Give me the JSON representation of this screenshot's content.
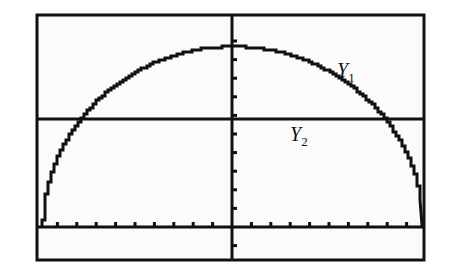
{
  "chart_data": {
    "type": "line",
    "title": "",
    "xlabel": "",
    "ylabel": "",
    "grid": false,
    "legend": "inline labels",
    "xlim": [
      -10,
      10
    ],
    "ylim": [
      -2,
      11
    ],
    "x_tick_spacing": 1,
    "y_tick_spacing": 1,
    "series": [
      {
        "name": "Y1",
        "label_text": "Y",
        "label_sub": "1",
        "kind": "upper semicircle",
        "center": [
          0,
          0
        ],
        "radius_x_units": 9.8,
        "radius_y_units": 9.7,
        "peak": [
          0,
          9.7
        ],
        "x_intercepts": [
          -9.8,
          9.8
        ]
      },
      {
        "name": "Y2",
        "label_text": "Y",
        "label_sub": "2",
        "kind": "horizontal line",
        "y": 5.8
      }
    ]
  },
  "screen": {
    "background": "#fbfbfb",
    "ink": "#111111"
  }
}
